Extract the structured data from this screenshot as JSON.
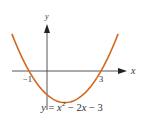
{
  "chart_data": {
    "type": "line",
    "title": "",
    "caption": {
      "lhs": "y",
      "eq": "=",
      "x": "x",
      "exp": "2",
      "rest": " − 2",
      "x2": "x",
      "tail": " − 3"
    },
    "xlabel": "x",
    "ylabel": "y",
    "function": "y = x^2 - 2x - 3",
    "x_ticks": [
      {
        "value": -1,
        "label": "−1"
      },
      {
        "value": 3,
        "label": "3"
      }
    ],
    "x": [
      -1.95,
      -1.5,
      -1,
      -0.5,
      0,
      0.5,
      1,
      1.5,
      2,
      2.5,
      3,
      3.5,
      3.95
    ],
    "values": [
      4.7,
      2.25,
      0,
      -1.75,
      -3,
      -3.75,
      -4,
      -3.75,
      -3,
      -1.75,
      0,
      2.25,
      4.7
    ],
    "xlim": [
      -1.95,
      4.4
    ],
    "ylim": [
      -4.5,
      5.5
    ],
    "grid": false,
    "curve_color": "#d2691e",
    "axis_color": "#333333"
  }
}
